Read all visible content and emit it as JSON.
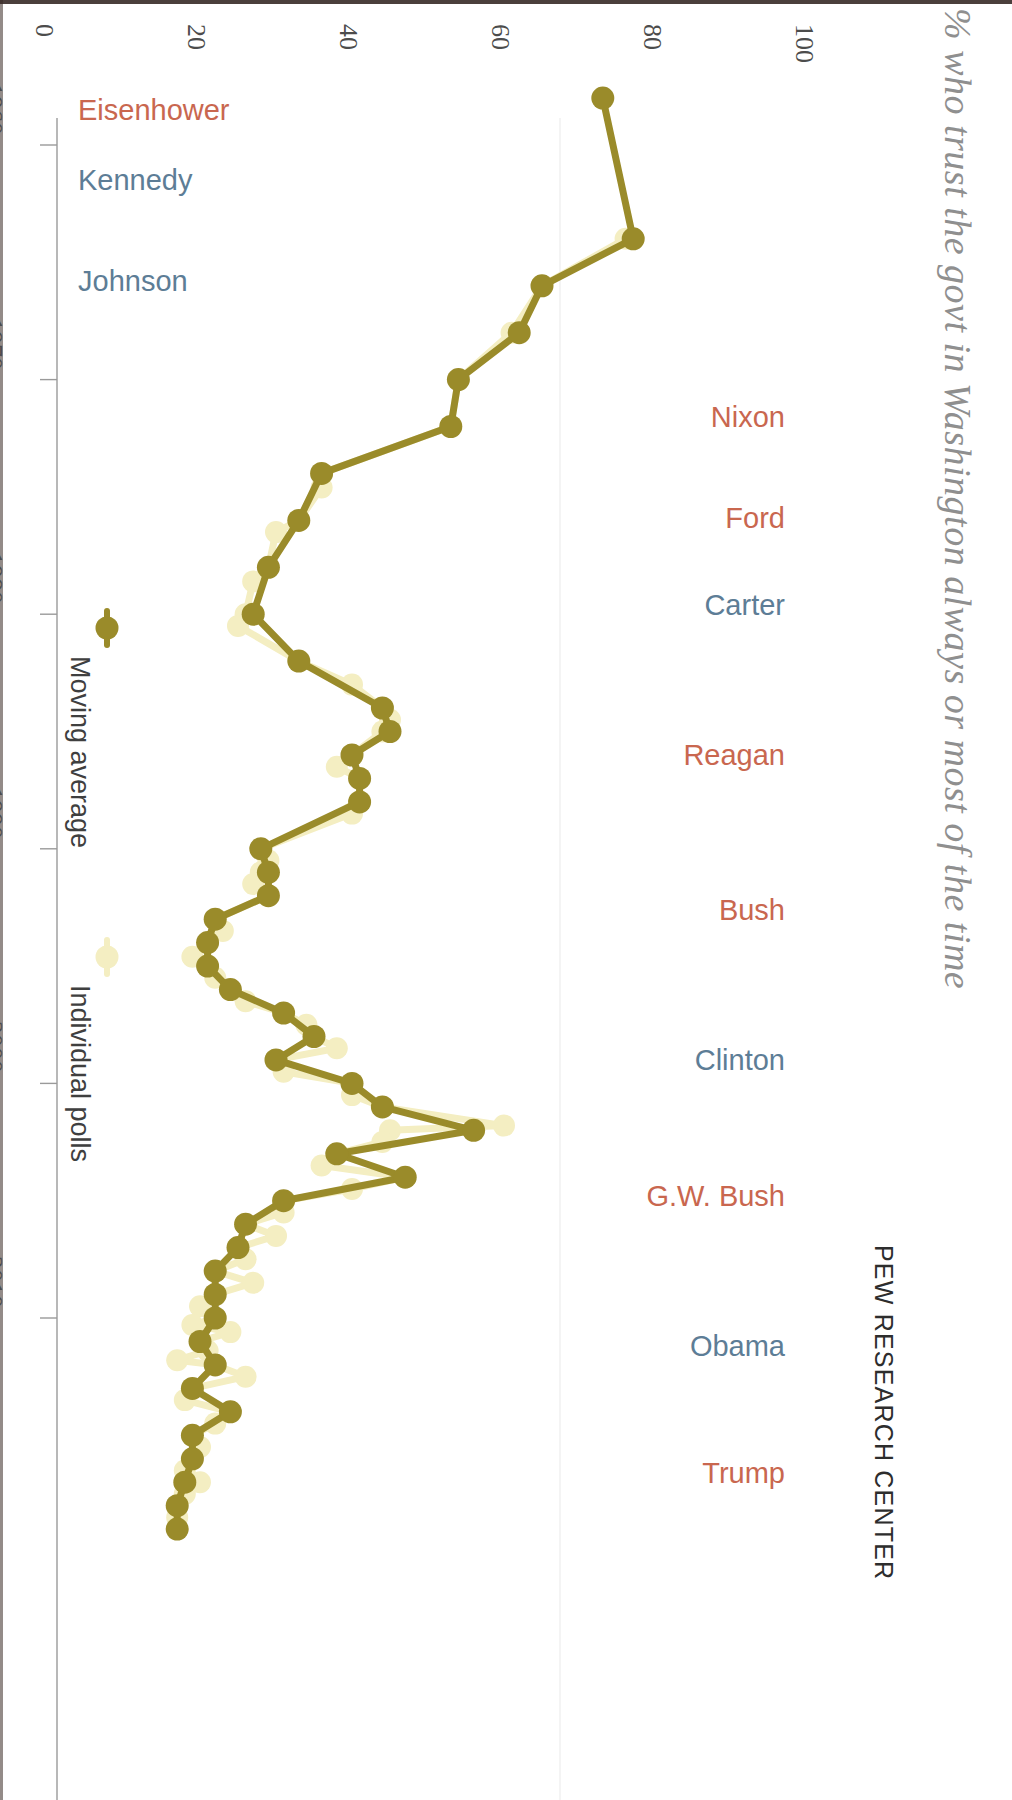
{
  "title": "% who trust the govt in Washington always or most of the time",
  "source": "PEW RESEARCH CENTER",
  "colors": {
    "moving_average": "#9a8b2a",
    "individual_polls": "#f4eec2",
    "republican": "#c9674f",
    "democrat": "#5d7d96",
    "axis": "#9a9a9a",
    "tick_text": "#4c4c4c",
    "title_text": "#8f8f8f",
    "source_text": "#2d2d2d",
    "background": "#ffffff"
  },
  "legend": {
    "position": "inside-left",
    "items": [
      {
        "label": "Moving average",
        "color": "#9a8b2a",
        "marker": "circle-line"
      },
      {
        "label": "Individual polls",
        "color": "#f4eec2",
        "marker": "circle-line"
      }
    ]
  },
  "value_axis": {
    "label": "",
    "ticks": [
      0,
      20,
      40,
      60,
      80,
      100
    ],
    "tick_labels": [
      "0",
      "20",
      "40",
      "60",
      "80",
      "100"
    ],
    "min": 0,
    "max": 100,
    "orientation": "horizontal-top"
  },
  "year_axis": {
    "ticks": [
      1960,
      1970,
      1980,
      1990,
      2000,
      2010
    ],
    "tick_labels": [
      "1960",
      "1970",
      "1980",
      "1990",
      "2000",
      "2010"
    ],
    "min": 1957,
    "max": 2019,
    "orientation": "vertical-left"
  },
  "presidents": [
    {
      "name": "Eisenhower",
      "party": "republican",
      "year": 1958.5,
      "side": "left"
    },
    {
      "name": "Kennedy",
      "party": "democrat",
      "year": 1961.5,
      "side": "left"
    },
    {
      "name": "Johnson",
      "party": "democrat",
      "year": 1965.8,
      "side": "left"
    },
    {
      "name": "Nixon",
      "party": "republican",
      "year": 1971.6,
      "side": "right"
    },
    {
      "name": "Ford",
      "party": "republican",
      "year": 1975.9,
      "side": "right"
    },
    {
      "name": "Carter",
      "party": "democrat",
      "year": 1979.6,
      "side": "right"
    },
    {
      "name": "Reagan",
      "party": "republican",
      "year": 1986.0,
      "side": "right"
    },
    {
      "name": "Bush",
      "party": "republican",
      "year": 1992.6,
      "side": "right"
    },
    {
      "name": "Clinton",
      "party": "democrat",
      "year": 1999.0,
      "side": "right"
    },
    {
      "name": "G.W. Bush",
      "party": "republican",
      "year": 2004.8,
      "side": "right"
    },
    {
      "name": "Obama",
      "party": "democrat",
      "year": 2011.2,
      "side": "right"
    },
    {
      "name": "Trump",
      "party": "republican",
      "year": 2016.6,
      "side": "right"
    }
  ],
  "chart_data": {
    "type": "line",
    "title": "% who trust the govt in Washington always or most of the time",
    "subtitle": "",
    "xlabel": "",
    "ylabel": "",
    "xlim": [
      1957,
      2019
    ],
    "ylim": [
      0,
      100
    ],
    "grid": false,
    "legend_position": "inside-left",
    "orientation": "rotated-90-clockwise",
    "note": "Time axis runs vertically (top=1958, bottom=2019); percentage axis runs horizontally (left=0, right=100).",
    "series": [
      {
        "name": "Individual polls",
        "color": "#f4eec2",
        "x": [
          1964,
          1966,
          1968,
          1970,
          1972,
          1974,
          1974.6,
          1976,
          1976.5,
          1978,
          1978.6,
          1980,
          1980.5,
          1982,
          1983,
          1984,
          1984.5,
          1985,
          1986,
          1986.5,
          1987,
          1988,
          1988.5,
          1990,
          1990.5,
          1991,
          1991.5,
          1992,
          1993,
          1993.5,
          1994,
          1994.6,
          1995,
          1995.5,
          1996,
          1996.5,
          1997,
          1997.5,
          1998,
          1998.5,
          1999,
          1999.5,
          2000,
          2000.5,
          2001,
          2001.8,
          2002,
          2002.5,
          2003,
          2003.5,
          2004,
          2004.5,
          2005,
          2005.5,
          2006,
          2006.5,
          2007,
          2007.5,
          2008,
          2008.5,
          2009,
          2009.5,
          2010,
          2010.3,
          2010.6,
          2011,
          2011.4,
          2011.8,
          2012,
          2012.5,
          2013,
          2013.5,
          2014,
          2014.5,
          2015,
          2015.5,
          2016,
          2016.5,
          2017,
          2017.5,
          2018,
          2018.5,
          2019
        ],
        "y": [
          76,
          65,
          61,
          54,
          53,
          36,
          36,
          33,
          30,
          29,
          27,
          26,
          25,
          33,
          40,
          44,
          45,
          44,
          40,
          38,
          41,
          41,
          40,
          28,
          29,
          28,
          27,
          29,
          22,
          23,
          21,
          19,
          21,
          22,
          24,
          26,
          31,
          34,
          35,
          38,
          30,
          31,
          40,
          40,
          44,
          60,
          45,
          44,
          38,
          36,
          47,
          40,
          31,
          31,
          26,
          30,
          25,
          26,
          22,
          27,
          22,
          20,
          22,
          19,
          24,
          20,
          21,
          17,
          22,
          26,
          19,
          18,
          24,
          22,
          19,
          20,
          19,
          18,
          20,
          18,
          17,
          17,
          17
        ]
      },
      {
        "name": "Moving average",
        "color": "#9a8b2a",
        "x": [
          1958,
          1964,
          1966,
          1968,
          1970,
          1972,
          1974,
          1976,
          1978,
          1980,
          1982,
          1984,
          1985,
          1986,
          1987,
          1988,
          1990,
          1991,
          1992,
          1993,
          1994,
          1995,
          1996,
          1997,
          1998,
          1999,
          2000,
          2001,
          2002,
          2003,
          2004,
          2005,
          2006,
          2007,
          2008,
          2009,
          2010,
          2011,
          2012,
          2013,
          2014,
          2015,
          2016,
          2017,
          2018,
          2019
        ],
        "y": [
          73,
          77,
          65,
          62,
          54,
          53,
          36,
          33,
          29,
          27,
          33,
          44,
          45,
          40,
          41,
          41,
          28,
          29,
          29,
          22,
          21,
          21,
          24,
          31,
          35,
          30,
          40,
          44,
          56,
          38,
          47,
          31,
          26,
          25,
          22,
          22,
          22,
          20,
          22,
          19,
          24,
          19,
          19,
          18,
          17,
          17
        ]
      }
    ],
    "key_points": [
      {
        "label": "Peak trust (Johnson, 1964)",
        "year": 1964,
        "value": 77
      },
      {
        "label": "Post-9/11 spike",
        "year": 2002,
        "value": 56
      },
      {
        "label": "Record low",
        "year": 2019,
        "value": 17
      }
    ]
  }
}
